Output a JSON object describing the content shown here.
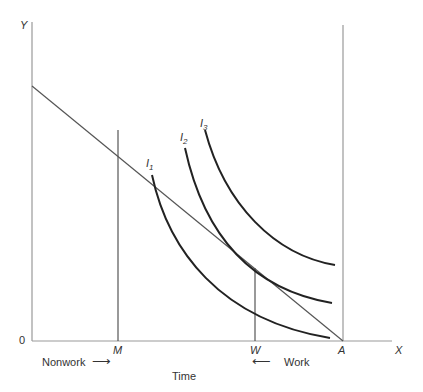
{
  "diagram": {
    "axes": {
      "y_label": "Y",
      "x_label": "X",
      "origin_label": "0",
      "x_title": "Time"
    },
    "points": {
      "M": "M",
      "W": "W",
      "A": "A"
    },
    "curves": [
      {
        "name": "I",
        "sub": "1"
      },
      {
        "name": "I",
        "sub": "2"
      },
      {
        "name": "I",
        "sub": "3"
      }
    ],
    "annotations": {
      "nonwork": "Nonwork",
      "work": "Work",
      "right_arrow": "⟶",
      "left_arrow": "⟵"
    },
    "colors": {
      "axis": "#999999",
      "budget_line": "#555555",
      "curves": "#222222"
    }
  }
}
